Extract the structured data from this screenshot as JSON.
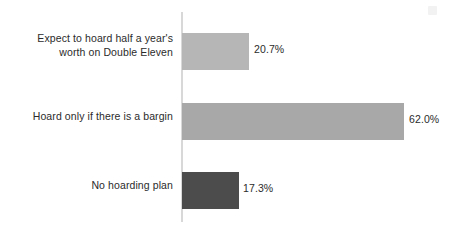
{
  "chart_data": {
    "type": "bar",
    "orientation": "horizontal",
    "title": "",
    "subtitle": "",
    "xlabel": "",
    "ylabel": "",
    "grid": false,
    "legend": null,
    "axis": {
      "vertical_axis_visible": true,
      "x_range_percent": [
        0,
        62.0
      ],
      "tick_labels": []
    },
    "value_suffix": "%",
    "categories": [
      "Expect to hoard half a year's\nworth on Double Eleven",
      "Hoard only if there is a bargin",
      "No hoarding plan"
    ],
    "values": [
      20.7,
      62.0,
      17.3
    ],
    "value_labels": [
      "20.7%",
      "62.0%",
      "17.3%"
    ],
    "bar_colors": [
      "#b6b6b6",
      "#a8a8a8",
      "#4c4c4c"
    ],
    "bar_geometry": [
      {
        "top": 33,
        "width": 67
      },
      {
        "top": 103,
        "width": 222
      },
      {
        "top": 172,
        "width": 57
      }
    ],
    "label_tops": [
      32,
      110,
      179
    ],
    "value_label_lefts": [
      254,
      409,
      243
    ],
    "value_label_tops": [
      42,
      112,
      181
    ],
    "colors": {
      "background": "#ffffff",
      "axis": "#d8d8d8",
      "text": "#2b2b2b"
    }
  }
}
